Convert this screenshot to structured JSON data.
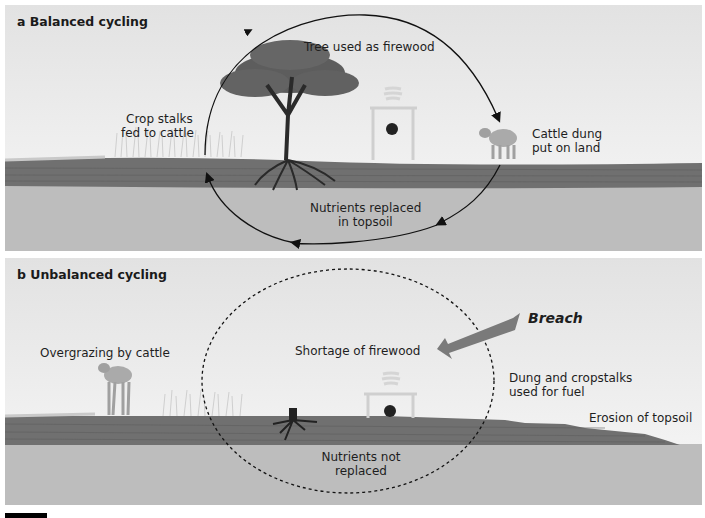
{
  "panels": {
    "a": {
      "title": "a  Balanced cycling",
      "labels": {
        "tree": "Tree used as firewood",
        "crop_1": "Crop stalks",
        "crop_2": "fed to cattle",
        "dung_1": "Cattle dung",
        "dung_2": "put on land",
        "nutrients_1": "Nutrients replaced",
        "nutrients_2": "in topsoil"
      },
      "cycle_style": "solid with arrows (closed loop)"
    },
    "b": {
      "title": "b  Unbalanced cycling",
      "labels": {
        "overgrazing": "Overgrazing by cattle",
        "shortage": "Shortage of firewood",
        "breach": "Breach",
        "dung_1": "Dung and cropstalks",
        "dung_2": "used for fuel",
        "erosion": "Erosion of topsoil",
        "nutrients_1": "Nutrients not",
        "nutrients_2": "replaced"
      },
      "cycle_style": "dashed (broken loop)"
    }
  },
  "colors": {
    "sky_top": "#e4e4e4",
    "sky_bottom": "#f7f7f7",
    "topsoil": "#6f6f6f",
    "subsoil": "#bdbdbd",
    "tree": "#5a5a5a",
    "breach_arrow": "#7a7a7a",
    "text": "#1e1e1e"
  }
}
